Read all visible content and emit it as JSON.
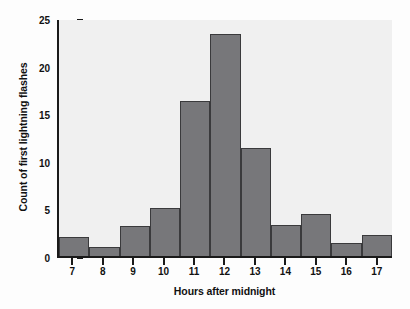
{
  "chart_data": {
    "type": "bar",
    "title": "",
    "subtitle": "",
    "xlabel": "Hours after midnight",
    "ylabel": "Count of first lightning flashes",
    "categories": [
      "7",
      "8",
      "9",
      "10",
      "11",
      "12",
      "13",
      "14",
      "15",
      "16",
      "17"
    ],
    "values": [
      2.0,
      1.0,
      3.2,
      5.1,
      16.4,
      23.5,
      11.4,
      3.3,
      4.4,
      1.4,
      2.2
    ],
    "ylim": [
      0,
      25
    ],
    "yticks": [
      0,
      5,
      10,
      15,
      20,
      25
    ],
    "ytick_labels": [
      "0",
      "5",
      "10",
      "15",
      "20",
      "25"
    ],
    "xtick_labels": [
      "7",
      "8",
      "9",
      "10",
      "11",
      "12",
      "13",
      "14",
      "15",
      "16",
      "17"
    ],
    "grid": false,
    "legend": null,
    "legend_position": "none",
    "annotations": [],
    "colors": {
      "bar_fill": "#77777a",
      "bar_edge": "#3a3a3c",
      "plot_background": "#f0f0f0",
      "figure_background": "#fdfdfd",
      "axis": "#1a1a1a",
      "text": "#111111"
    }
  }
}
